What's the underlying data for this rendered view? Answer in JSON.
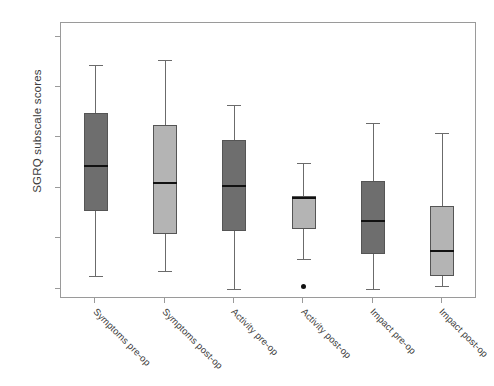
{
  "chart_data": {
    "type": "box",
    "title": "",
    "xlabel": "",
    "ylabel": "SGRQ subscale scores",
    "ylim": [
      0,
      105
    ],
    "y_ticks": [
      0,
      20,
      40,
      60,
      80,
      100
    ],
    "grid": false,
    "legend": "none",
    "categories": [
      "Symptoms pre-op",
      "Symptoms post-op",
      "Activity pre-op",
      "Activity post-op",
      "Impact pre-op",
      "Impact post-op"
    ],
    "boxes": [
      {
        "label": "Symptoms pre-op",
        "color": "#6e6e6e",
        "shade": "dark",
        "whisker_low": 5,
        "q1": 31,
        "median": 49,
        "q3": 70,
        "whisker_high": 89,
        "outliers": []
      },
      {
        "label": "Symptoms post-op",
        "color": "#b4b4b4",
        "shade": "light",
        "whisker_low": 7,
        "q1": 22,
        "median": 42,
        "q3": 65,
        "whisker_high": 91,
        "outliers": []
      },
      {
        "label": "Activity pre-op",
        "color": "#6e6e6e",
        "shade": "dark",
        "whisker_low": 0,
        "q1": 23,
        "median": 41,
        "q3": 59,
        "whisker_high": 73,
        "outliers": []
      },
      {
        "label": "Activity post-op",
        "color": "#b4b4b4",
        "shade": "light",
        "whisker_low": 12,
        "q1": 24,
        "median": 36,
        "q3": 37,
        "whisker_high": 50,
        "outliers": [
          1
        ]
      },
      {
        "label": "Impact pre-op",
        "color": "#6e6e6e",
        "shade": "dark",
        "whisker_low": 0,
        "q1": 14,
        "median": 27,
        "q3": 43,
        "whisker_high": 66,
        "outliers": []
      },
      {
        "label": "Impact post-op",
        "color": "#b4b4b4",
        "shade": "light",
        "whisker_low": 1,
        "q1": 5,
        "median": 15,
        "q3": 33,
        "whisker_high": 62,
        "outliers": []
      }
    ]
  },
  "axes": {
    "y_title": "SGRQ subscale scores",
    "y_tick_labels": [
      "0",
      "20",
      "40",
      "60",
      "80",
      "100"
    ],
    "x_tick_labels": [
      "Symptoms pre-op",
      "Symptoms post-op",
      "Activity pre-op",
      "Activity post-op",
      "Impact pre-op",
      "Impact post-op"
    ]
  },
  "colors": {
    "box_dark": "#6e6e6e",
    "box_light": "#b4b4b4",
    "frame": "#9a9a9a",
    "median": "#111111",
    "whisker": "#6b6b6b",
    "background": "#ffffff"
  }
}
